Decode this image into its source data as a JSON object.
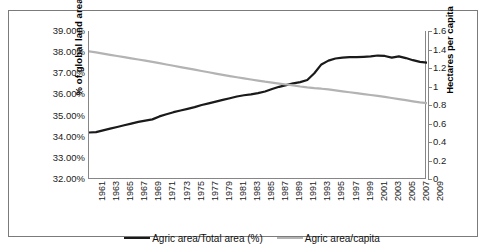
{
  "chart_data": {
    "type": "line",
    "title": "",
    "xlabel": "",
    "ylabel": "% of global land area",
    "y2label": "Hectares per capita",
    "grid": false,
    "legend_position": "bottom-center",
    "ylim": [
      32.0,
      39.0
    ],
    "y2lim": [
      0,
      1.6
    ],
    "xlim": [
      1961,
      2009
    ],
    "ytick_labels": [
      "39.00%",
      "38.00%",
      "37.00%",
      "36.00%",
      "35.00%",
      "34.00%",
      "33.00%",
      "32.00%"
    ],
    "ytick_values": [
      39.0,
      38.0,
      37.0,
      36.0,
      35.0,
      34.0,
      33.0,
      32.0
    ],
    "y2tick_labels": [
      "1.6",
      "1.4",
      "1.2",
      "1",
      "0.8",
      "0.6",
      "0.4",
      "0.2",
      "0"
    ],
    "y2tick_values": [
      1.6,
      1.4,
      1.2,
      1.0,
      0.8,
      0.6,
      0.4,
      0.2,
      0
    ],
    "xtick_labels": [
      "1961",
      "1963",
      "1965",
      "1967",
      "1969",
      "1971",
      "1973",
      "1975",
      "1977",
      "1979",
      "1981",
      "1983",
      "1985",
      "1987",
      "1989",
      "1991",
      "1993",
      "1995",
      "1997",
      "1999",
      "2001",
      "2003",
      "2005",
      "2007",
      "2009"
    ],
    "x": [
      1961,
      1962,
      1963,
      1964,
      1965,
      1966,
      1967,
      1968,
      1969,
      1970,
      1971,
      1972,
      1973,
      1974,
      1975,
      1976,
      1977,
      1978,
      1979,
      1980,
      1981,
      1982,
      1983,
      1984,
      1985,
      1986,
      1987,
      1988,
      1989,
      1990,
      1991,
      1992,
      1993,
      1994,
      1995,
      1996,
      1997,
      1998,
      1999,
      2000,
      2001,
      2002,
      2003,
      2004,
      2005,
      2006,
      2007,
      2008,
      2009
    ],
    "series": [
      {
        "name": "Agric area/Total area (%)",
        "axis": "left",
        "color": "#1a1a1a",
        "values": [
          34.2,
          34.22,
          34.3,
          34.38,
          34.46,
          34.54,
          34.62,
          34.7,
          34.76,
          34.82,
          34.96,
          35.06,
          35.16,
          35.24,
          35.32,
          35.4,
          35.5,
          35.58,
          35.66,
          35.74,
          35.82,
          35.9,
          35.96,
          36.0,
          36.06,
          36.14,
          36.26,
          36.36,
          36.44,
          36.52,
          36.58,
          36.68,
          37.0,
          37.42,
          37.6,
          37.7,
          37.74,
          37.76,
          37.76,
          37.78,
          37.8,
          37.84,
          37.82,
          37.74,
          37.8,
          37.72,
          37.62,
          37.54,
          37.5
        ]
      },
      {
        "name": "Agric area/capita",
        "axis": "right",
        "color": "#b3b3b3",
        "values": [
          1.38,
          1.368,
          1.355,
          1.342,
          1.33,
          1.317,
          1.305,
          1.292,
          1.279,
          1.266,
          1.252,
          1.238,
          1.224,
          1.21,
          1.196,
          1.182,
          1.168,
          1.154,
          1.14,
          1.126,
          1.113,
          1.1,
          1.088,
          1.076,
          1.064,
          1.052,
          1.042,
          1.032,
          1.022,
          1.012,
          1.0,
          0.99,
          0.982,
          0.976,
          0.968,
          0.958,
          0.948,
          0.938,
          0.928,
          0.918,
          0.908,
          0.898,
          0.888,
          0.876,
          0.864,
          0.852,
          0.84,
          0.828,
          0.82
        ]
      }
    ]
  },
  "axes": {
    "left_title": "% of  global land area",
    "right_title": "Hectares per capita"
  },
  "legend": {
    "entries": [
      {
        "label": "Agric area/Total area (%)",
        "color": "#1a1a1a"
      },
      {
        "label": "Agric area/capita",
        "color": "#b3b3b3"
      }
    ]
  },
  "colors": {
    "series_primary": "#1a1a1a",
    "series_secondary": "#b3b3b3",
    "axis": "#868686",
    "frame": "#7b7b7b",
    "background": "#ffffff"
  }
}
